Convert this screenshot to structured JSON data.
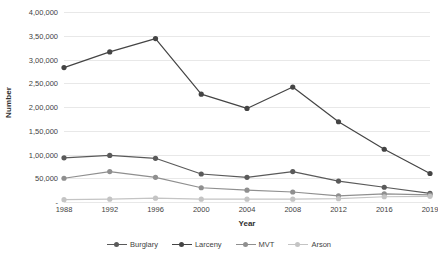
{
  "chart_data": {
    "type": "line",
    "title": "",
    "xlabel": "Year",
    "ylabel": "Number",
    "categories": [
      "1988",
      "1992",
      "1996",
      "2000",
      "2004",
      "2008",
      "2012",
      "2016",
      "2019"
    ],
    "ylim": [
      0,
      400000
    ],
    "ytick_values": [
      400000,
      350000,
      300000,
      250000,
      200000,
      150000,
      100000,
      50000,
      0
    ],
    "ytick_labels": [
      "4,00,000",
      "3,50,000",
      "3,00,000",
      "2,50,000",
      "2,00,000",
      "1,50,000",
      "1,00,000",
      "50,000",
      "-"
    ],
    "grid": "horizontal",
    "legend_position": "bottom",
    "series": [
      {
        "name": "Burglary",
        "color": "#5a5a5a",
        "values": [
          93000,
          98000,
          92000,
          59000,
          52000,
          64000,
          44000,
          31000,
          18000
        ]
      },
      {
        "name": "Larceny",
        "color": "#444444",
        "values": [
          283000,
          316000,
          344000,
          227000,
          197000,
          242000,
          169000,
          111000,
          60000
        ]
      },
      {
        "name": "MVT",
        "color": "#8f8f8f",
        "values": [
          50000,
          64000,
          52000,
          30000,
          25000,
          21000,
          13000,
          17000,
          15000
        ]
      },
      {
        "name": "Arson",
        "color": "#c4c4c4",
        "values": [
          5000,
          6000,
          8000,
          6000,
          6000,
          6000,
          7000,
          11000,
          12000
        ]
      }
    ]
  }
}
